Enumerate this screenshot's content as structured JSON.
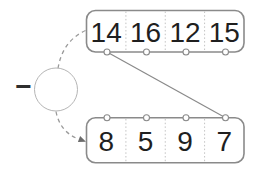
{
  "figure": {
    "operator_node": {
      "symbol": "−"
    },
    "top_register": {
      "cells": [
        "14",
        "16",
        "12",
        "15"
      ]
    },
    "bottom_register": {
      "cells": [
        "8",
        "5",
        "9",
        "7"
      ]
    },
    "link": {
      "from": "top-port-1",
      "to": "bottom-port-4"
    },
    "colors": {
      "background": "#ffffff",
      "box_border": "#8a8a8a",
      "digit": "#1f1f1f",
      "divider": "#c3c3c3",
      "port_fill": "#ffffff",
      "port_stroke": "#8a8a8a",
      "connector": "#8a8a8a",
      "dashed_link": "#9a9a9a",
      "circle_outline": "#b5b5b5",
      "arrowhead": "#6b6b6b",
      "operator": "#2e2e2e"
    }
  }
}
